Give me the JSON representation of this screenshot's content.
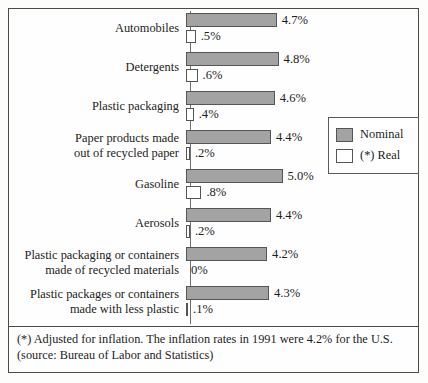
{
  "chart_data": {
    "type": "bar",
    "orientation": "horizontal",
    "title": "",
    "xlabel": "",
    "ylabel": "",
    "grid": false,
    "xlim": [
      0,
      5.2
    ],
    "legend_position": "right-middle",
    "categories": [
      "Automobiles",
      "Detergents",
      "Plastic packaging",
      "Paper products made\nout of recycled paper",
      "Gasoline",
      "Aerosols",
      "Plastic packaging or containers\nmade of recycled materials",
      "Plastic packages or containers\nmade with less plastic"
    ],
    "series": [
      {
        "name": "Nominal",
        "color": "#a3a3a3",
        "values": [
          4.7,
          4.8,
          4.6,
          4.4,
          5.0,
          4.4,
          4.2,
          4.3
        ],
        "labels": [
          "4.7%",
          "4.8%",
          "4.6%",
          "4.4%",
          "5.0%",
          "4.4%",
          "4.2%",
          "4.3%"
        ]
      },
      {
        "name": "(*) Real",
        "color": "#ffffff",
        "values": [
          0.5,
          0.6,
          0.4,
          0.2,
          0.8,
          0.2,
          0.0,
          0.1
        ],
        "labels": [
          ".5%",
          ".6%",
          ".4%",
          ".2%",
          ".8%",
          ".2%",
          "0%",
          ".1%"
        ]
      }
    ],
    "annotations": [
      "(*) Adjusted for inflation. The inflation rates in 1991 were 4.2% for the U.S.",
      "(source: Bureau of Labor and Statistics)"
    ]
  },
  "legend": {
    "items": [
      {
        "label": "Nominal",
        "swatch": "gray-filled-square"
      },
      {
        "label": "(*) Real",
        "swatch": "white-outlined-square"
      }
    ]
  },
  "footnote": {
    "line1": "(*) Adjusted for inflation. The inflation rates in 1991 were 4.2% for the U.S.",
    "line2": "(source: Bureau of Labor and Statistics)"
  }
}
